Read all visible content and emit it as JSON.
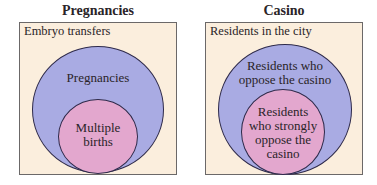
{
  "diagrams": [
    {
      "title": "Pregnancies",
      "universe_label": "Embryo transfers",
      "outer_set": "Pregnancies",
      "inner_set": "Multiple\nbirths"
    },
    {
      "title": "Casino",
      "universe_label": "Residents in the city",
      "outer_set": "Residents who\noppose the casino",
      "inner_set": "Residents\nwho strongly\noppose the\ncasino"
    }
  ],
  "colors": {
    "universe_fill": "#fbeedd",
    "outer_fill": "#a9abe3",
    "inner_fill": "#e3a7ce",
    "stroke": "#2e2a4a"
  }
}
